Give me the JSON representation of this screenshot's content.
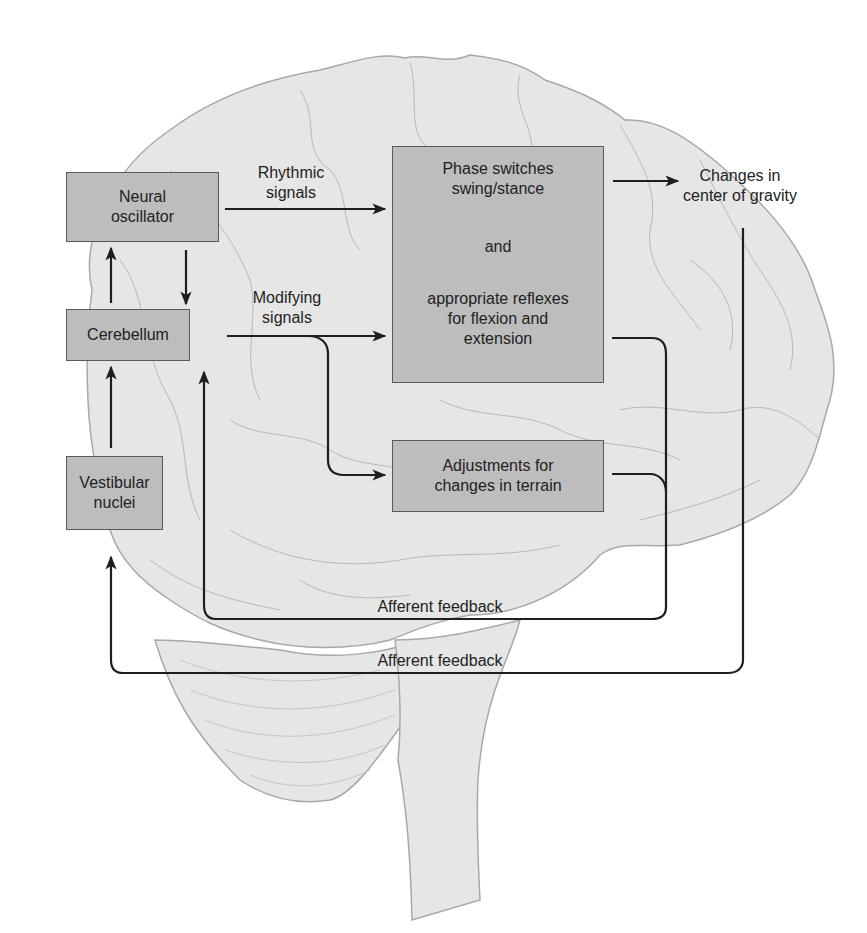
{
  "diagram": {
    "type": "flowchart",
    "background_illustration": "brain-sagittal-outline",
    "colors": {
      "box_fill": "#bdbdbd",
      "box_border": "#5a5a5a",
      "brain_fill": "#e6e6e6",
      "brain_stroke": "#a8a8a8",
      "arrow": "#1e1e1e",
      "text": "#222222"
    },
    "nodes": {
      "neural_oscillator": {
        "line1": "Neural",
        "line2": "oscillator"
      },
      "cerebellum": {
        "line1": "Cerebellum"
      },
      "vestibular_nuclei": {
        "line1": "Vestibular",
        "line2": "nuclei"
      },
      "phase_switches": {
        "line1": "Phase switches",
        "line2": "swing/stance",
        "line3": "and",
        "line4": "appropriate reflexes",
        "line5": "for flexion and",
        "line6": "extension"
      },
      "adjustments": {
        "line1": "Adjustments for",
        "line2": "changes in terrain"
      },
      "center_of_gravity": {
        "line1": "Changes in",
        "line2": "center of gravity"
      }
    },
    "edge_labels": {
      "rhythmic": {
        "line1": "Rhythmic",
        "line2": "signals"
      },
      "modifying": {
        "line1": "Modifying",
        "line2": "signals"
      },
      "afferent_inner": "Afferent feedback",
      "afferent_outer": "Afferent feedback"
    },
    "edges": [
      {
        "from": "Neural oscillator",
        "to": "Phase switches",
        "label": "Rhythmic signals"
      },
      {
        "from": "Neural oscillator",
        "to": "Cerebellum"
      },
      {
        "from": "Cerebellum",
        "to": "Neural oscillator"
      },
      {
        "from": "Cerebellum",
        "to": "Phase switches",
        "label": "Modifying signals"
      },
      {
        "from": "Cerebellum",
        "to": "Adjustments for changes in terrain"
      },
      {
        "from": "Vestibular nuclei",
        "to": "Cerebellum"
      },
      {
        "from": "Phase switches",
        "to": "Changes in center of gravity"
      },
      {
        "from": "Phase switches / Adjustments",
        "to": "Cerebellum",
        "label": "Afferent feedback"
      },
      {
        "from": "Changes in center of gravity",
        "to": "Vestibular nuclei",
        "label": "Afferent feedback"
      }
    ]
  }
}
